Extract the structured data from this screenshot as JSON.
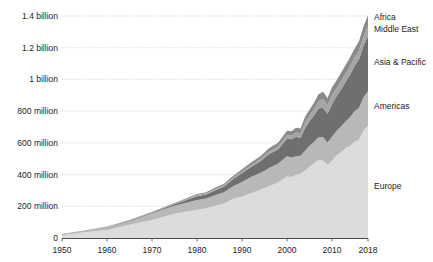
{
  "chart_data": {
    "type": "area",
    "stacked": true,
    "title": "",
    "subtitle": "",
    "xlabel": "",
    "ylabel": "",
    "grid": true,
    "legend_position": "right-inline",
    "xlim": [
      1950,
      2018
    ],
    "ylim": [
      0,
      1400000000
    ],
    "xticks": [
      "1950",
      "1960",
      "1970",
      "1980",
      "1990",
      "2000",
      "2010",
      "2018"
    ],
    "xtick_values": [
      1950,
      1960,
      1970,
      1980,
      1990,
      2000,
      2010,
      2018
    ],
    "yticks": [
      "0",
      "200 million",
      "400 million",
      "600 million",
      "800 million",
      "1 billion",
      "1.2 billion",
      "1.4 billion"
    ],
    "ytick_values": [
      0,
      200000000,
      400000000,
      600000000,
      800000000,
      1000000000,
      1200000000,
      1400000000
    ],
    "x": [
      1950,
      1955,
      1960,
      1965,
      1970,
      1975,
      1980,
      1982,
      1984,
      1986,
      1988,
      1990,
      1992,
      1994,
      1995,
      1996,
      1998,
      2000,
      2001,
      2002,
      2003,
      2004,
      2005,
      2006,
      2007,
      2008,
      2009,
      2010,
      2011,
      2012,
      2013,
      2014,
      2015,
      2016,
      2017,
      2018
    ],
    "series": [
      {
        "name": "Europe",
        "color": "#dcdcdc",
        "values": [
          16800000,
          36000000,
          50400000,
          83000000,
          113000000,
          153000000,
          178000000,
          187000000,
          203000000,
          217000000,
          248000000,
          261000000,
          282000000,
          305000000,
          315000000,
          327000000,
          350000000,
          388000000,
          385000000,
          399000000,
          405000000,
          425000000,
          449000000,
          471000000,
          492000000,
          489000000,
          462000000,
          489000000,
          520000000,
          540000000,
          566000000,
          580000000,
          607000000,
          620000000,
          677000000,
          710000000
        ]
      },
      {
        "name": "Americas",
        "color": "#b8b8b8",
        "values": [
          7500000,
          9800000,
          16700000,
          23200000,
          42300000,
          50000000,
          62300000,
          62000000,
          67000000,
          71000000,
          79000000,
          92800000,
          102000000,
          105000000,
          109000000,
          114000000,
          119000000,
          128000000,
          122000000,
          116000000,
          113000000,
          125000000,
          133000000,
          135000000,
          143000000,
          148000000,
          141000000,
          150000000,
          156000000,
          163000000,
          168000000,
          181000000,
          193000000,
          201000000,
          211000000,
          216000000
        ]
      },
      {
        "name": "Asia & Pacific",
        "color": "#6f6f6f",
        "values": [
          200000,
          800000,
          2900000,
          4400000,
          6200000,
          10100000,
          23000000,
          25000000,
          30000000,
          36000000,
          43000000,
          55800000,
          64000000,
          73000000,
          82000000,
          89000000,
          89000000,
          110000000,
          115000000,
          124000000,
          113000000,
          144000000,
          154000000,
          167000000,
          182000000,
          184000000,
          181000000,
          205000000,
          218000000,
          234000000,
          250000000,
          269000000,
          284000000,
          306000000,
          324000000,
          348000000
        ]
      },
      {
        "name": "Middle East",
        "color": "#a5a5a5",
        "values": [
          200000,
          300000,
          600000,
          1100000,
          1900000,
          3500000,
          7100000,
          7500000,
          8000000,
          8500000,
          9000000,
          9600000,
          11000000,
          13000000,
          14000000,
          15000000,
          18000000,
          24000000,
          23000000,
          27000000,
          29000000,
          36000000,
          37000000,
          41000000,
          46000000,
          55000000,
          53000000,
          56000000,
          50000000,
          52000000,
          51000000,
          53000000,
          56000000,
          56000000,
          58000000,
          64000000
        ]
      },
      {
        "name": "Africa",
        "color": "#8a8a8a",
        "values": [
          500000,
          800000,
          1400000,
          2400000,
          2900000,
          4700000,
          7200000,
          7700000,
          8600000,
          9300000,
          12000000,
          14800000,
          17000000,
          18000000,
          19000000,
          21000000,
          24000000,
          26000000,
          28000000,
          29000000,
          30000000,
          33000000,
          35000000,
          39000000,
          44000000,
          46000000,
          46000000,
          50000000,
          50000000,
          53000000,
          55000000,
          56000000,
          53000000,
          58000000,
          63000000,
          67000000
        ]
      }
    ]
  },
  "axes": {
    "y_labels": [
      "1.4 billion",
      "1.2 billion",
      "1 billion",
      "800 million",
      "600 million",
      "400 million",
      "200 million",
      "0"
    ],
    "x_labels": [
      "1950",
      "1960",
      "1970",
      "1980",
      "1990",
      "2000",
      "2010",
      "2018"
    ]
  },
  "series_labels": {
    "africa": "Africa",
    "middle_east": "Middle East",
    "asia_pacific": "Asia & Pacific",
    "americas": "Americas",
    "europe": "Europe"
  },
  "colors": {
    "europe": "#dcdcdc",
    "americas": "#b8b8b8",
    "asia_pacific": "#6f6f6f",
    "middle_east": "#a5a5a5",
    "africa": "#8a8a8a",
    "grid": "#c9c9c9",
    "axis": "#5a5a5a",
    "text": "#1c1c1c"
  }
}
